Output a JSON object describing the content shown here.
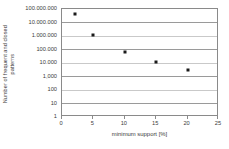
{
  "chart_data": {
    "type": "scatter",
    "title": "",
    "xlabel": "minimum support [%]",
    "ylabel": "Number of frequent and closed patterns",
    "ylabel_lines": [
      "Number of frequent and closed",
      "patterns"
    ],
    "xlim": [
      0,
      25
    ],
    "ylim": [
      1,
      100000000
    ],
    "yscale": "log",
    "grid": true,
    "legend": "none",
    "marker": "square",
    "marker_color": "#1a1a1a",
    "x_ticks": [
      "0",
      "5",
      "10",
      "15",
      "20",
      "25"
    ],
    "x_tick_values": [
      0,
      5,
      10,
      15,
      20,
      25
    ],
    "y_ticks": [
      "100.000.000",
      "10.000.000",
      "1.000.000",
      "100.000",
      "10.000",
      "1,000",
      "100",
      "10",
      "1"
    ],
    "y_tick_values": [
      100000000,
      10000000,
      1000000,
      100000,
      10000,
      1000,
      100,
      10,
      1
    ],
    "x": [
      2,
      5,
      10,
      15,
      20
    ],
    "values": [
      40000000,
      1200000,
      70000,
      11000,
      3000
    ],
    "points": [
      {
        "x": 2,
        "y": 40000000
      },
      {
        "x": 5,
        "y": 1200000
      },
      {
        "x": 10,
        "y": 70000
      },
      {
        "x": 15,
        "y": 11000
      },
      {
        "x": 20,
        "y": 3000
      }
    ],
    "colors": {
      "axis": "#8a8a8a",
      "gridline": "#9a9a9a",
      "gridline_faint": "#c9c9c9",
      "text": "#3c3c3c",
      "background": "#ffffff"
    }
  }
}
